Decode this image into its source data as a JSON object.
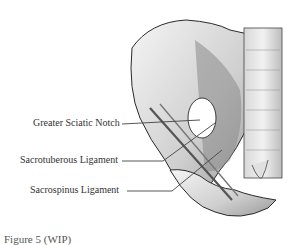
{
  "figure": {
    "labels": [
      {
        "text": "Greater Sciatic Notch",
        "x": 33,
        "y": 117
      },
      {
        "text": "Sacrotuberous Ligament",
        "x": 20,
        "y": 152
      },
      {
        "text": "Sacrospinus Ligament",
        "x": 30,
        "y": 183
      }
    ],
    "caption": "Figure 5 (WIP)"
  },
  "colors": {
    "background": "#ffffff",
    "text": "#333333",
    "bone_outline": "#2a2a2a",
    "shading": "#8a8a8a"
  }
}
